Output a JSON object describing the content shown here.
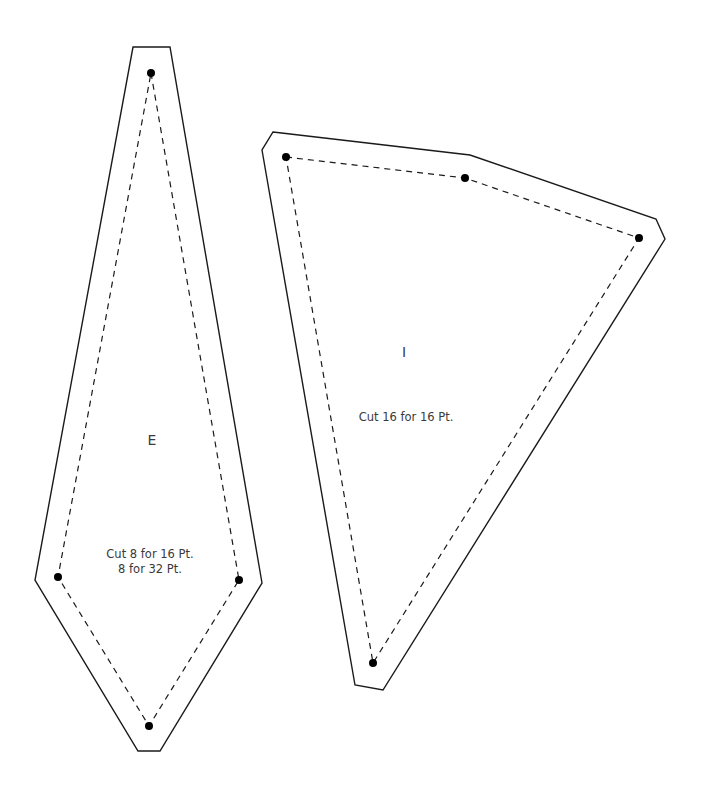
{
  "pieces": [
    {
      "id": "E",
      "letter": "E",
      "note_line1": "Cut 8 for 16 Pt.",
      "note_line2": "8 for 32 Pt."
    },
    {
      "id": "I",
      "letter": "I",
      "note_line1": "Cut 16 for 16 Pt."
    }
  ],
  "colors": {
    "line": "#1a1a1a",
    "text": "#3a3a3a",
    "background": "#ffffff"
  }
}
